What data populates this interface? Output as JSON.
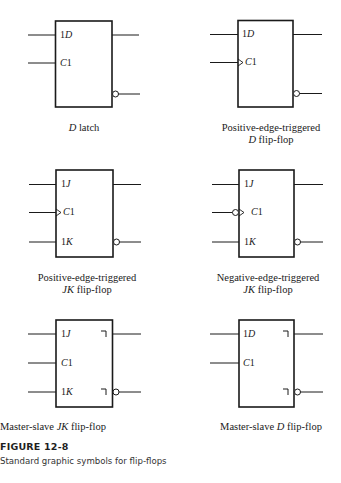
{
  "figure": {
    "number": "FIGURE 12-8",
    "caption": "Standard graphic symbols for flip-flops"
  },
  "symbols": [
    {
      "id": "d-latch",
      "title_lines": [
        {
          "italic": "D",
          "rest": " latch"
        }
      ],
      "pins": [
        "1D",
        "C1"
      ],
      "clock": "level",
      "postponed_output": false
    },
    {
      "id": "pos-edge-d",
      "title_lines": [
        {
          "italic": "",
          "rest": "Positive-edge-triggered"
        },
        {
          "italic": "D",
          "rest": " flip-flop"
        }
      ],
      "pins": [
        "1D",
        "C1"
      ],
      "clock": "positive-edge",
      "postponed_output": false
    },
    {
      "id": "pos-edge-jk",
      "title_lines": [
        {
          "italic": "",
          "rest": "Positive-edge-triggered"
        },
        {
          "italic": "JK",
          "rest": " flip-flop"
        }
      ],
      "pins": [
        "1J",
        "C1",
        "1K"
      ],
      "clock": "positive-edge",
      "postponed_output": false
    },
    {
      "id": "neg-edge-jk",
      "title_lines": [
        {
          "italic": "",
          "rest": "Negative-edge-triggered"
        },
        {
          "italic": "JK",
          "rest": " flip-flop"
        }
      ],
      "pins": [
        "1J",
        "C1",
        "1K"
      ],
      "clock": "negative-edge",
      "postponed_output": false
    },
    {
      "id": "ms-jk",
      "title_lines": [
        {
          "italic": "",
          "rest": "Master-slave "
        },
        {
          "italic": "JK",
          "rest": " flip-flop"
        }
      ],
      "pins": [
        "1J",
        "C1",
        "1K"
      ],
      "clock": "level",
      "postponed_output": true
    },
    {
      "id": "ms-d",
      "title_lines": [
        {
          "italic": "",
          "rest": "Master-slave "
        },
        {
          "italic": "D",
          "rest": " flip-flop"
        }
      ],
      "pins": [
        "1D",
        "C1"
      ],
      "clock": "level",
      "postponed_output": true
    }
  ],
  "labels": {
    "s0_l1_i": "D",
    "s0_l1_r": " latch",
    "s1_l1": "Positive-edge-triggered",
    "s1_l2_i": "D",
    "s1_l2_r": " flip-flop",
    "s2_l1": "Positive-edge-triggered",
    "s2_l2_i": "JK",
    "s2_l2_r": " flip-flop",
    "s3_l1": "Negative-edge-triggered",
    "s3_l2_i": "JK",
    "s3_l2_r": " flip-flop",
    "s4_l1_r": "Master-slave ",
    "s4_l1_i": "JK",
    "s4_l1_r2": " flip-flop",
    "s5_l1_r": "Master-slave ",
    "s5_l1_i": "D",
    "s5_l1_r2": " flip-flop"
  },
  "pins": {
    "s0": {
      "p1_n": "1",
      "p1_i": "D",
      "p2_i": "C",
      "p2_n": "1"
    },
    "s1": {
      "p1_n": "1",
      "p1_i": "D",
      "p2_i": "C",
      "p2_n": "1"
    },
    "s2": {
      "p1_n": "1",
      "p1_i": "J",
      "p2_i": "C",
      "p2_n": "1",
      "p3_n": "1",
      "p3_i": "K"
    },
    "s3": {
      "p1_n": "1",
      "p1_i": "J",
      "p2_i": "C",
      "p2_n": "1",
      "p3_n": "1",
      "p3_i": "K"
    },
    "s4": {
      "p1_n": "1",
      "p1_i": "J",
      "p2_i": "C",
      "p2_n": "1",
      "p3_n": "1",
      "p3_i": "K"
    },
    "s5": {
      "p1_n": "1",
      "p1_i": "D",
      "p2_i": "C",
      "p2_n": "1"
    }
  }
}
